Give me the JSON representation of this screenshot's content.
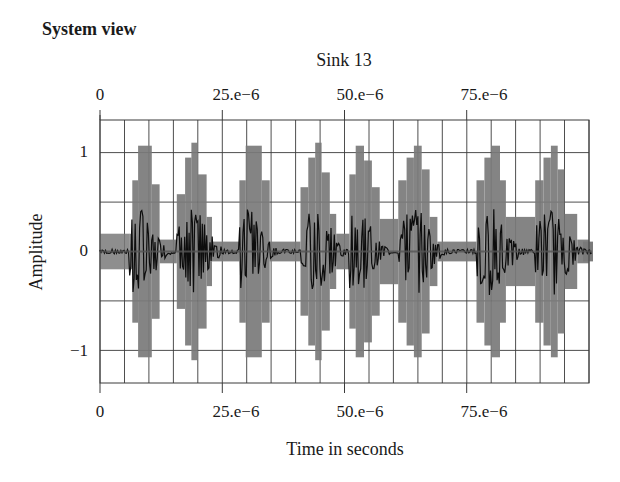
{
  "page": {
    "title": "System view"
  },
  "chart_data": {
    "type": "line",
    "title": "Sink 13",
    "xlabel": "Time in seconds",
    "ylabel": "Amplitude",
    "xlim": [
      0,
      0.0001
    ],
    "ylim": [
      -1.33,
      1.33
    ],
    "grid": true,
    "legend": null,
    "x_ticks_top": [
      "0",
      "25.e−6",
      "50.e−6",
      "75.e−6"
    ],
    "x_ticks_bottom": [
      "0",
      "25.e−6",
      "50.e−6",
      "75.e−6"
    ],
    "x_tick_values": [
      0,
      2.5e-05,
      5e-05,
      7.5e-05
    ],
    "y_ticks": [
      "1",
      "0",
      "−1"
    ],
    "y_tick_values": [
      1,
      0,
      -1
    ],
    "minor_x_step": 5e-06,
    "minor_y_step": 0.5,
    "burst_period": 1.23e-05,
    "bursts": [
      {
        "start": 6e-06,
        "envelope": [
          [
            0.0,
            0.18
          ],
          [
            6e-07,
            0.72
          ],
          [
            1.8e-06,
            1.07
          ],
          [
            4.6e-06,
            0.68
          ],
          [
            6.2e-06,
            0.12
          ]
        ]
      },
      {
        "start": 1.57e-05,
        "envelope": [
          [
            0.0,
            0.58
          ],
          [
            1.7e-06,
            0.95
          ],
          [
            3e-06,
            1.1
          ],
          [
            4.3e-06,
            0.78
          ],
          [
            6.1e-06,
            0.35
          ],
          [
            7.2e-06,
            0.1
          ]
        ]
      },
      {
        "start": 2.85e-05,
        "envelope": [
          [
            0.0,
            0.72
          ],
          [
            1.3e-06,
            1.07
          ],
          [
            4.6e-06,
            0.72
          ],
          [
            6.2e-06,
            0.1
          ]
        ]
      },
      {
        "start": 4.1e-05,
        "envelope": [
          [
            0.0,
            0.65
          ],
          [
            1.6e-06,
            0.95
          ],
          [
            3e-06,
            1.1
          ],
          [
            4.3e-06,
            0.8
          ],
          [
            6e-06,
            0.38
          ],
          [
            7.3e-06,
            0.18
          ]
        ]
      },
      {
        "start": 5.1e-05,
        "envelope": [
          [
            0.0,
            0.78
          ],
          [
            1.3e-06,
            1.07
          ],
          [
            3e-06,
            0.92
          ],
          [
            4.6e-06,
            0.65
          ],
          [
            6.2e-06,
            0.33
          ]
        ]
      },
      {
        "start": 6.1e-05,
        "envelope": [
          [
            0.0,
            0.72
          ],
          [
            1.7e-06,
            0.95
          ],
          [
            3.2e-06,
            1.07
          ],
          [
            4.8e-06,
            0.83
          ],
          [
            6.4e-06,
            0.35
          ],
          [
            8e-06,
            0.1
          ]
        ]
      },
      {
        "start": 7.7e-05,
        "envelope": [
          [
            0.0,
            0.72
          ],
          [
            1.6e-06,
            0.95
          ],
          [
            3e-06,
            1.07
          ],
          [
            4.8e-06,
            0.72
          ],
          [
            6e-06,
            0.35
          ]
        ]
      },
      {
        "start": 8.9e-05,
        "envelope": [
          [
            0.0,
            0.72
          ],
          [
            1.7e-06,
            0.95
          ],
          [
            3.2e-06,
            1.07
          ],
          [
            4.6e-06,
            0.83
          ],
          [
            6e-06,
            0.38
          ],
          [
            8.6e-06,
            0.12
          ]
        ]
      }
    ],
    "inner_oscillation_amplitude": 0.45,
    "colors": {
      "envelope_fill": "#7a7a7a",
      "inner_signal": "#0d0d0d",
      "grid": "#3a3a3a",
      "frame": "#3a3a3a",
      "baseline": "#555555"
    }
  }
}
